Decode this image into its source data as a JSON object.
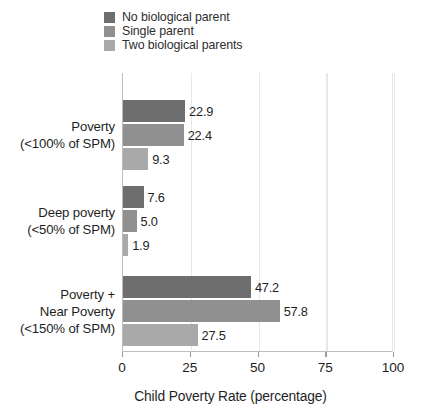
{
  "chart_data": {
    "type": "bar",
    "orientation": "horizontal",
    "title": "",
    "subtitle": "",
    "xlabel": "Child Poverty Rate (percentage)",
    "ylabel": "",
    "xlim": [
      0,
      100
    ],
    "xticks": [
      "0",
      "25",
      "50",
      "75",
      "100"
    ],
    "grid": true,
    "legend_position": "top-left",
    "categories": [
      "Poverty\n(<100% of SPM)",
      "Deep poverty\n(<50% of SPM)",
      "Poverty +\nNear Poverty\n(<150% of SPM)"
    ],
    "category_lines": [
      [
        "Poverty",
        "(<100% of SPM)"
      ],
      [
        "Deep poverty",
        "(<50% of SPM)"
      ],
      [
        "Poverty +",
        "Near Poverty",
        "(<150% of SPM)"
      ]
    ],
    "series": [
      {
        "name": "No biological parent",
        "color": "#6e6e6e",
        "values": [
          22.9,
          7.6,
          47.2
        ],
        "labels": [
          "22.9",
          "7.6",
          "47.2"
        ]
      },
      {
        "name": "Single parent",
        "color": "#909090",
        "values": [
          22.4,
          5.0,
          57.8
        ],
        "labels": [
          "22.4",
          "5.0",
          "57.8"
        ]
      },
      {
        "name": "Two biological parents",
        "color": "#a9a9a9",
        "values": [
          9.3,
          1.9,
          27.5
        ],
        "labels": [
          "9.3",
          "1.9",
          "27.5"
        ]
      }
    ]
  },
  "legend": {
    "items": [
      {
        "label": "No biological parent",
        "color": "#6e6e6e"
      },
      {
        "label": "Single parent",
        "color": "#909090"
      },
      {
        "label": "Two biological parents",
        "color": "#a9a9a9"
      }
    ]
  },
  "axis": {
    "x_title": "Child Poverty Rate (percentage)",
    "x_tick_labels": [
      "0",
      "25",
      "50",
      "75",
      "100"
    ]
  }
}
